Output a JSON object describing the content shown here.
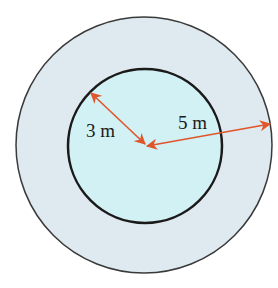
{
  "diagram": {
    "type": "concentric-circles",
    "colors": {
      "outer_fill": "#dfe9f0",
      "inner_fill": "#d2f1f5",
      "outer_stroke": "#3a3a3a",
      "inner_stroke": "#1a1a1a",
      "arrow": "#e0552a"
    },
    "inner_radius_label": "3 m",
    "outer_radius_label": "5 m"
  }
}
